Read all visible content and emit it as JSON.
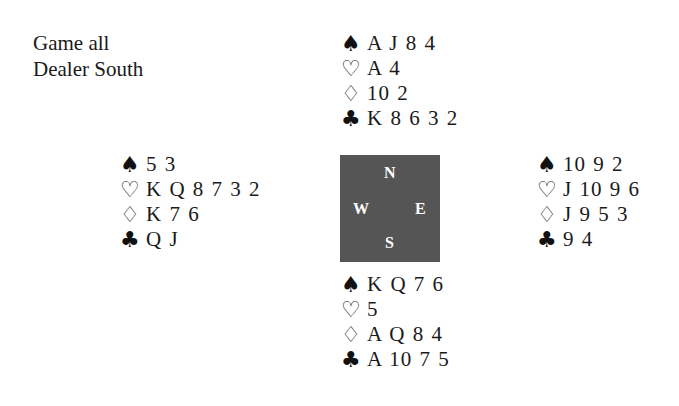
{
  "info": {
    "vulnerability": "Game all",
    "dealer": "Dealer South"
  },
  "suits": {
    "spades": "♠",
    "hearts": "♡",
    "diamonds": "♢",
    "clubs": "♣"
  },
  "compass": {
    "north": "N",
    "south": "S",
    "west": "W",
    "east": "E",
    "background": "#555555"
  },
  "hands": {
    "north": {
      "spades": "A J 8 4",
      "hearts": "A 4",
      "diamonds": "10 2",
      "clubs": "K 8 6 3 2"
    },
    "west": {
      "spades": "5 3",
      "hearts": "K Q 8 7 3 2",
      "diamonds": "K 7 6",
      "clubs": "Q J"
    },
    "east": {
      "spades": "10 9 2",
      "hearts": "J 10 9 6",
      "diamonds": "J 9 5 3",
      "clubs": "9 4"
    },
    "south": {
      "spades": "K Q 7 6",
      "hearts": "5",
      "diamonds": "A Q 8 4",
      "clubs": "A 10 7 5"
    }
  }
}
